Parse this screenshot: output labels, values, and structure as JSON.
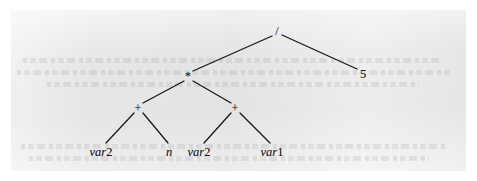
{
  "figure": {
    "kind": "binary-expression-tree",
    "caption": "",
    "panel_color": "#e9e9e9",
    "page_color": "#ffffff",
    "edge_color": "#16161a"
  },
  "tree": {
    "expression": "((var2 + n) * (var2 + var1)) / 5",
    "nodes": [
      {
        "id": "root",
        "label": "/",
        "role": "operator",
        "x": 277,
        "y": 31,
        "depth": 0
      },
      {
        "id": "mul",
        "label": "*",
        "role": "operator",
        "x": 188,
        "y": 76,
        "depth": 1
      },
      {
        "id": "five",
        "label": "5",
        "role": "literal",
        "x": 363,
        "y": 74,
        "depth": 1
      },
      {
        "id": "plusL",
        "label": "+",
        "role": "operator",
        "x": 138,
        "y": 108,
        "depth": 2
      },
      {
        "id": "plusR",
        "label": "+",
        "role": "operator",
        "x": 235,
        "y": 108,
        "depth": 2
      },
      {
        "id": "leafA",
        "label": "var2",
        "role": "variable",
        "x": 101,
        "y": 152,
        "depth": 3,
        "name": "var",
        "index": "2"
      },
      {
        "id": "leafB",
        "label": "n",
        "role": "variable",
        "x": 169,
        "y": 152,
        "depth": 3,
        "name": "n",
        "index": ""
      },
      {
        "id": "leafC",
        "label": "var2",
        "role": "variable",
        "x": 199,
        "y": 152,
        "depth": 3,
        "name": "var",
        "index": "2"
      },
      {
        "id": "leafD",
        "label": "var1",
        "role": "variable",
        "x": 272,
        "y": 152,
        "depth": 3,
        "name": "var",
        "index": "1"
      }
    ],
    "edges": [
      {
        "from": "root",
        "to": "mul",
        "x1": 272,
        "y1": 36,
        "x2": 193,
        "y2": 71
      },
      {
        "from": "root",
        "to": "five",
        "x1": 282,
        "y1": 35,
        "x2": 357,
        "y2": 69
      },
      {
        "from": "mul",
        "to": "plusL",
        "x1": 184,
        "y1": 81,
        "x2": 143,
        "y2": 103
      },
      {
        "from": "mul",
        "to": "plusR",
        "x1": 193,
        "y1": 81,
        "x2": 231,
        "y2": 103
      },
      {
        "from": "plusL",
        "to": "leafA",
        "x1": 134,
        "y1": 113,
        "x2": 106,
        "y2": 143
      },
      {
        "from": "plusL",
        "to": "leafB",
        "x1": 143,
        "y1": 113,
        "x2": 168,
        "y2": 143
      },
      {
        "from": "plusR",
        "to": "leafC",
        "x1": 231,
        "y1": 113,
        "x2": 204,
        "y2": 143
      },
      {
        "from": "plusR",
        "to": "leafD",
        "x1": 240,
        "y1": 113,
        "x2": 270,
        "y2": 143
      }
    ]
  }
}
